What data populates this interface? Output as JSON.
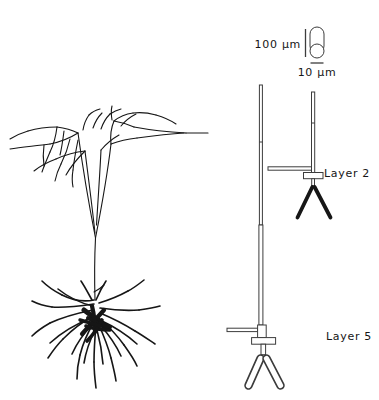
{
  "legend": {
    "length_scale": "100 μm",
    "diameter_scale": "10 μm"
  },
  "labels": {
    "layer2": "Layer 2",
    "layer5": "Layer 5"
  },
  "colors": {
    "ink": "#161616",
    "schematic": "#3c3c3c",
    "background": "#ffffff"
  }
}
